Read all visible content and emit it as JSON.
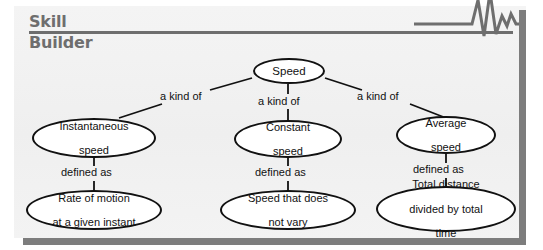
{
  "header": {
    "title_line1": "Skill",
    "title_line2": "Builder",
    "rule_color": "#6e6e6e",
    "text_color": "#6e6e6e",
    "waveform_icon": "ekg-waveform-icon"
  },
  "panel": {
    "background_color": "#f1f1f1",
    "border_color": "#7d7d7d"
  },
  "diagram": {
    "type": "concept-map",
    "root": {
      "id": "speed",
      "label": "Speed"
    },
    "edge_labels": {
      "kind_of": "a kind of",
      "defined_as": "defined as"
    },
    "branches": [
      {
        "id": "instantaneous",
        "relation": "a kind of",
        "concept_line1": "Instantaneous",
        "concept_line2": "speed",
        "definition_relation": "defined as",
        "definition_line1": "Rate of motion",
        "definition_line2": "at a given instant",
        "definition_line3": ""
      },
      {
        "id": "constant",
        "relation": "a kind of",
        "concept_line1": "Constant",
        "concept_line2": "speed",
        "definition_relation": "defined as",
        "definition_line1": "Speed that does",
        "definition_line2": "not vary",
        "definition_line3": ""
      },
      {
        "id": "average",
        "relation": "a kind of",
        "concept_line1": "Average",
        "concept_line2": "speed",
        "definition_relation": "defined as",
        "definition_line1": "Total distance",
        "definition_line2": "divided by total",
        "definition_line3": "time"
      }
    ],
    "node_border_color": "#111111",
    "node_fill_color": "#ffffff",
    "connector_color": "#111111"
  }
}
